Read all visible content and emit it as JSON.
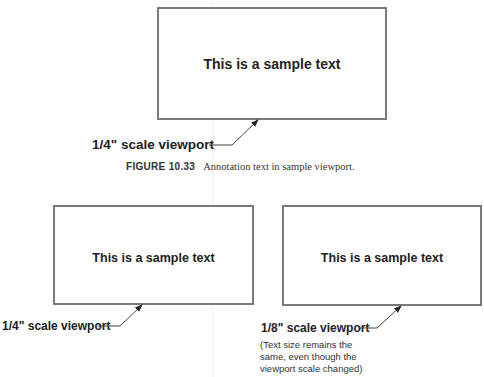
{
  "figure_top": {
    "viewport": {
      "text": "This is a sample text",
      "box": {
        "x": 157,
        "y": 7,
        "w": 230,
        "h": 113
      }
    },
    "label": "1/4\" scale viewport"
  },
  "caption": {
    "figure_number": "FIGURE 10.33",
    "text": "Annotation text in sample viewport."
  },
  "figure_bottom": {
    "left_viewport": {
      "text": "This is a sample text",
      "box": {
        "x": 53,
        "y": 205,
        "w": 201,
        "h": 100
      },
      "label": "1/4\" scale viewport"
    },
    "right_viewport": {
      "text": "This is a sample text",
      "box": {
        "x": 282,
        "y": 205,
        "w": 200,
        "h": 101
      },
      "label": "1/8\" scale viewport",
      "note": "(Text size remains the\nsame, even though the\nviewport scale changed)"
    }
  },
  "colors": {
    "border": "#7a7a7a",
    "text": "#222222",
    "background": "#ffffff"
  }
}
